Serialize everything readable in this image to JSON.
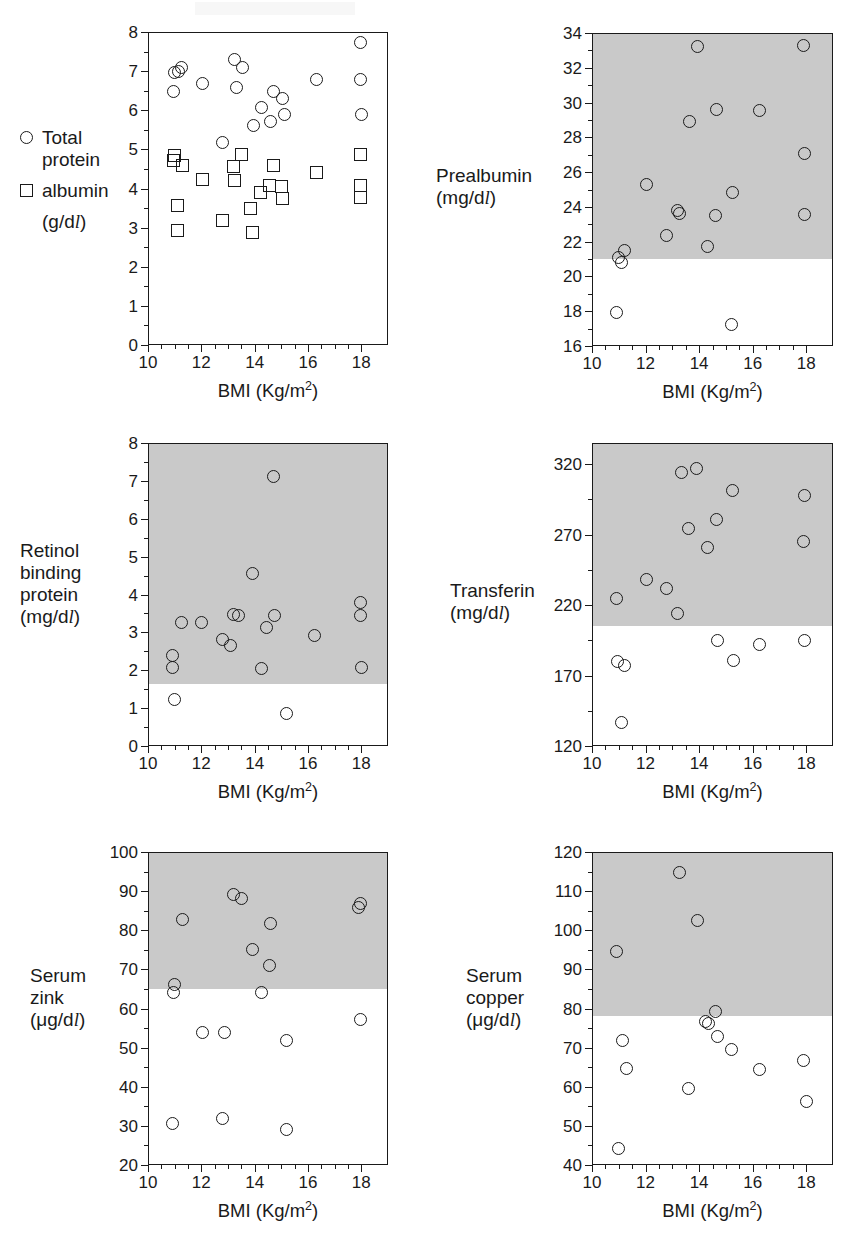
{
  "figure": {
    "shared_xlabel_html": "BMI (Kg/m<sup>2</sup>)",
    "xlabel_main": "BMI",
    "xlabel_unit": "(Kg/m2)",
    "band_color": "#c9c9c9",
    "marker_color": "#1a1a1a",
    "xlim": [
      10,
      19
    ],
    "xticks": [
      10,
      12,
      14,
      16,
      18
    ]
  },
  "legend": {
    "items": [
      {
        "marker": "circle",
        "label": "Total\nprotein"
      },
      {
        "marker": "square",
        "label": "albumin"
      }
    ],
    "unit": "(g/dl)"
  },
  "chart_data": [
    {
      "type": "scatter",
      "panel": "total-protein-albumin",
      "title": "Total protein / albumin",
      "ylabel": "(g/dl)",
      "xlabel": "BMI (Kg/m2)",
      "xlim": [
        10,
        19
      ],
      "ylim": [
        0,
        8
      ],
      "yticks": [
        0,
        1,
        2,
        3,
        4,
        5,
        6,
        7,
        8
      ],
      "xticks": [
        10,
        12,
        14,
        16,
        18
      ],
      "grid": false,
      "shaded_band": null,
      "series": [
        {
          "name": "Total protein",
          "marker": "circle",
          "points": [
            [
              10.95,
              6.47
            ],
            [
              11.0,
              6.97
            ],
            [
              11.15,
              7.0
            ],
            [
              11.25,
              7.1
            ],
            [
              12.05,
              6.69
            ],
            [
              12.8,
              5.18
            ],
            [
              13.25,
              7.3
            ],
            [
              13.3,
              6.57
            ],
            [
              13.55,
              7.1
            ],
            [
              13.95,
              5.6
            ],
            [
              14.25,
              6.08
            ],
            [
              14.6,
              5.7
            ],
            [
              14.7,
              6.49
            ],
            [
              15.05,
              6.3
            ],
            [
              15.1,
              5.9
            ],
            [
              16.3,
              6.78
            ],
            [
              17.95,
              7.72
            ],
            [
              17.95,
              6.78
            ],
            [
              18.0,
              5.9
            ]
          ]
        },
        {
          "name": "albumin",
          "marker": "square",
          "points": [
            [
              10.95,
              4.72
            ],
            [
              11.0,
              4.85
            ],
            [
              11.1,
              3.56
            ],
            [
              11.1,
              2.93
            ],
            [
              11.3,
              4.6
            ],
            [
              12.05,
              4.23
            ],
            [
              12.8,
              3.17
            ],
            [
              13.2,
              4.55
            ],
            [
              13.25,
              4.2
            ],
            [
              13.5,
              4.88
            ],
            [
              13.85,
              3.5
            ],
            [
              13.9,
              2.87
            ],
            [
              14.2,
              3.9
            ],
            [
              14.55,
              4.07
            ],
            [
              14.7,
              4.6
            ],
            [
              15.0,
              4.05
            ],
            [
              15.05,
              3.75
            ],
            [
              16.3,
              4.4
            ],
            [
              17.95,
              4.87
            ],
            [
              17.95,
              4.07
            ],
            [
              17.95,
              3.78
            ]
          ]
        }
      ]
    },
    {
      "type": "scatter",
      "panel": "prealbumin",
      "title": "Prealbumin",
      "ylabel": "(mg/dl)",
      "xlabel": "BMI (Kg/m2)",
      "xlim": [
        10,
        19
      ],
      "ylim": [
        16,
        34
      ],
      "yticks": [
        16,
        18,
        20,
        22,
        24,
        26,
        28,
        30,
        32,
        34
      ],
      "xticks": [
        10,
        12,
        14,
        16,
        18
      ],
      "grid": false,
      "shaded_band": [
        21.0,
        34.0
      ],
      "series": [
        {
          "name": "Prealbumin",
          "marker": "circle",
          "points": [
            [
              10.9,
              17.9
            ],
            [
              11.0,
              21.1
            ],
            [
              11.1,
              20.8
            ],
            [
              11.2,
              21.5
            ],
            [
              12.05,
              25.3
            ],
            [
              12.8,
              22.35
            ],
            [
              13.2,
              23.8
            ],
            [
              13.25,
              23.6
            ],
            [
              13.65,
              28.9
            ],
            [
              13.95,
              33.2
            ],
            [
              14.3,
              21.75
            ],
            [
              14.6,
              23.5
            ],
            [
              14.65,
              29.6
            ],
            [
              15.2,
              17.25
            ],
            [
              15.25,
              24.85
            ],
            [
              16.25,
              29.55
            ],
            [
              17.9,
              33.3
            ],
            [
              17.95,
              27.05
            ],
            [
              17.95,
              23.55
            ]
          ]
        }
      ]
    },
    {
      "type": "scatter",
      "panel": "retinol-binding-protein",
      "title": "Retinol binding protein",
      "ylabel": "(mg/dl)",
      "xlabel": "BMI (Kg/m2)",
      "xlim": [
        10,
        19
      ],
      "ylim": [
        0,
        8
      ],
      "yticks": [
        0,
        1,
        2,
        3,
        4,
        5,
        6,
        7,
        8
      ],
      "xticks": [
        10,
        12,
        14,
        16,
        18
      ],
      "grid": false,
      "shaded_band": [
        1.65,
        8.0
      ],
      "series": [
        {
          "name": "Retinol binding protein",
          "marker": "circle",
          "points": [
            [
              10.9,
              2.4
            ],
            [
              10.9,
              2.08
            ],
            [
              11.0,
              1.22
            ],
            [
              11.25,
              3.25
            ],
            [
              12.0,
              3.25
            ],
            [
              12.8,
              2.8
            ],
            [
              13.1,
              2.65
            ],
            [
              13.2,
              3.47
            ],
            [
              13.4,
              3.45
            ],
            [
              13.9,
              4.55
            ],
            [
              14.25,
              2.05
            ],
            [
              14.45,
              3.12
            ],
            [
              14.7,
              7.12
            ],
            [
              14.75,
              3.45
            ],
            [
              15.2,
              0.85
            ],
            [
              16.25,
              2.92
            ],
            [
              17.95,
              3.78
            ],
            [
              17.95,
              3.45
            ],
            [
              18.0,
              2.08
            ]
          ]
        }
      ]
    },
    {
      "type": "scatter",
      "panel": "transferin",
      "title": "Transferin",
      "ylabel": "(mg/dl)",
      "xlabel": "BMI (Kg/m2)",
      "xlim": [
        10,
        19
      ],
      "ylim": [
        120,
        335
      ],
      "yticks": [
        120,
        170,
        220,
        270,
        320
      ],
      "xticks": [
        10,
        12,
        14,
        16,
        18
      ],
      "grid": false,
      "shaded_band": [
        205,
        335
      ],
      "series": [
        {
          "name": "Transferin",
          "marker": "circle",
          "points": [
            [
              10.9,
              225
            ],
            [
              10.95,
              180
            ],
            [
              11.1,
              137
            ],
            [
              11.2,
              177
            ],
            [
              12.05,
              238
            ],
            [
              12.8,
              232
            ],
            [
              13.2,
              214
            ],
            [
              13.35,
              314
            ],
            [
              13.6,
              274
            ],
            [
              13.9,
              317
            ],
            [
              14.3,
              261
            ],
            [
              14.65,
              281
            ],
            [
              14.7,
              195
            ],
            [
              15.25,
              301
            ],
            [
              15.3,
              181
            ],
            [
              16.25,
              192
            ],
            [
              17.9,
              265
            ],
            [
              17.95,
              298
            ],
            [
              17.95,
              195
            ]
          ]
        }
      ]
    },
    {
      "type": "scatter",
      "panel": "serum-zink",
      "title": "Serum zink",
      "ylabel": "(ug/dl)",
      "xlabel": "BMI (Kg/m2)",
      "xlim": [
        10,
        19
      ],
      "ylim": [
        20,
        100
      ],
      "yticks": [
        20,
        30,
        40,
        50,
        60,
        70,
        80,
        90,
        100
      ],
      "xticks": [
        10,
        12,
        14,
        16,
        18
      ],
      "grid": false,
      "shaded_band": [
        65,
        100
      ],
      "series": [
        {
          "name": "Serum zink",
          "marker": "circle",
          "points": [
            [
              10.9,
              30.5
            ],
            [
              10.95,
              64.2
            ],
            [
              11.0,
              66.2
            ],
            [
              11.3,
              82.8
            ],
            [
              12.05,
              53.8
            ],
            [
              12.8,
              31.8
            ],
            [
              12.85,
              53.8
            ],
            [
              13.2,
              89.2
            ],
            [
              13.5,
              88.0
            ],
            [
              13.9,
              75.0
            ],
            [
              14.25,
              64.2
            ],
            [
              14.55,
              70.9
            ],
            [
              14.6,
              81.7
            ],
            [
              15.2,
              29.0
            ],
            [
              15.2,
              51.8
            ],
            [
              17.9,
              85.9
            ],
            [
              17.95,
              86.9
            ],
            [
              17.95,
              57.2
            ]
          ]
        }
      ]
    },
    {
      "type": "scatter",
      "panel": "serum-copper",
      "title": "Serum copper",
      "ylabel": "(ug/dl)",
      "xlabel": "BMI (Kg/m2)",
      "xlim": [
        10,
        19
      ],
      "ylim": [
        40,
        120
      ],
      "yticks": [
        40,
        50,
        60,
        70,
        80,
        90,
        100,
        110,
        120
      ],
      "xticks": [
        10,
        12,
        14,
        16,
        18
      ],
      "grid": false,
      "shaded_band": [
        78,
        120
      ],
      "series": [
        {
          "name": "Serum copper",
          "marker": "circle",
          "points": [
            [
              10.9,
              94.6
            ],
            [
              11.0,
              44.3
            ],
            [
              11.15,
              71.7
            ],
            [
              11.3,
              64.7
            ],
            [
              13.25,
              114.8
            ],
            [
              13.6,
              59.6
            ],
            [
              13.95,
              102.5
            ],
            [
              14.25,
              76.7
            ],
            [
              14.35,
              76.2
            ],
            [
              14.6,
              79.3
            ],
            [
              14.7,
              72.9
            ],
            [
              15.2,
              69.6
            ],
            [
              16.25,
              64.5
            ],
            [
              17.9,
              66.6
            ],
            [
              18.0,
              56.3
            ]
          ]
        }
      ]
    }
  ],
  "panels": [
    {
      "key": "total-protein-albumin",
      "label_lines": []
    },
    {
      "key": "prealbumin",
      "label_lines": [
        "Prealbumin",
        "(mg/dl)"
      ]
    },
    {
      "key": "retinol-binding-protein",
      "label_lines": [
        "Retinol",
        "binding",
        "protein",
        "(mg/dl)"
      ]
    },
    {
      "key": "transferin",
      "label_lines": [
        "Transferin",
        "(mg/dl)"
      ]
    },
    {
      "key": "serum-zink",
      "label_lines": [
        "Serum",
        "zink",
        "(μg/dl)"
      ]
    },
    {
      "key": "serum-copper",
      "label_lines": [
        "Serum",
        "copper",
        "(μg/dl)"
      ]
    }
  ]
}
